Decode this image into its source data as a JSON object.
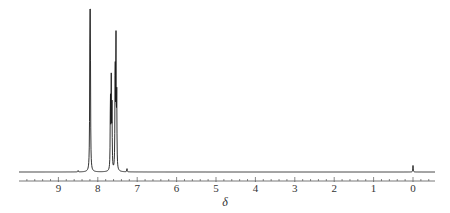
{
  "chart_data": {
    "type": "line",
    "title": "",
    "subtitle": "",
    "xlabel": "δ",
    "ylabel": "",
    "x_reversed": true,
    "xlim": [
      9.99,
      -0.56
    ],
    "grid": false,
    "legend": null,
    "x_major_ticks": [
      9,
      8,
      7,
      6,
      5,
      4,
      3,
      2,
      1,
      0
    ],
    "x_tick_labels": [
      "9",
      "8",
      "7",
      "6",
      "5",
      "4",
      "3",
      "2",
      "1",
      "0"
    ],
    "x_minor_tick_step": 0.2,
    "baseline_intensity": 0,
    "peaks": [
      {
        "shift": 8.2,
        "intensity": 1.0,
        "label": ""
      },
      {
        "shift": 8.19,
        "intensity": 0.88,
        "label": ""
      },
      {
        "shift": 7.68,
        "intensity": 0.47,
        "label": ""
      },
      {
        "shift": 7.66,
        "intensity": 0.56,
        "label": ""
      },
      {
        "shift": 7.64,
        "intensity": 0.38,
        "label": ""
      },
      {
        "shift": 7.56,
        "intensity": 0.7,
        "label": ""
      },
      {
        "shift": 7.54,
        "intensity": 0.85,
        "label": ""
      },
      {
        "shift": 7.52,
        "intensity": 0.45,
        "label": ""
      },
      {
        "shift": 7.26,
        "intensity": 0.02,
        "label": "CDCl3"
      },
      {
        "shift": 8.5,
        "intensity": 0.01,
        "label": ""
      },
      {
        "shift": 0.0,
        "intensity": 0.04,
        "label": "TMS"
      }
    ],
    "colors": {
      "trace": "#1a1a1a",
      "axis": "#555555",
      "text": "#333333"
    }
  },
  "layout": {
    "x_px_at_0ppm": 413,
    "px_per_ppm": 39.4,
    "plot_left_px": 19,
    "plot_right_px": 435,
    "baseline_y_px": 172,
    "max_peak_height_px": 163,
    "axis_y_px": 181,
    "major_tick_len_px": 4,
    "minor_tick_len_px": 2,
    "tick_label_y_px": 192,
    "xlabel_x_px": 225,
    "xlabel_y_px": 206
  }
}
